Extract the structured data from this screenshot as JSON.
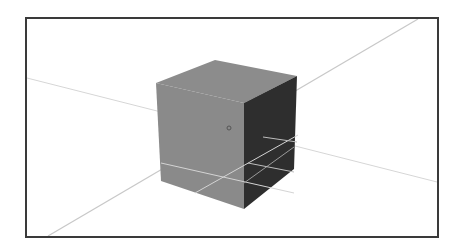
{
  "viewport": {
    "label": "3D viewport",
    "background": "#ffffff",
    "frame_color": "#3a3a3a"
  },
  "scene": {
    "object": "cube",
    "colors": {
      "top_face": "#8c8c8c",
      "front_face": "#8a8a8a",
      "right_face": "#2e2e2e",
      "grid_line": "#c8c8c8",
      "grid_line_on_object": "#d4d4d4"
    },
    "origin_marker": "small-circle"
  }
}
